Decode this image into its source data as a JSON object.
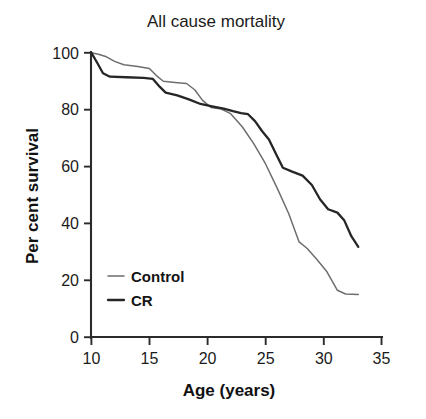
{
  "chart_data": {
    "type": "line",
    "title": "All cause mortality",
    "xlabel": "Age (years)",
    "ylabel": "Per cent survival",
    "xlim": [
      10,
      35
    ],
    "ylim": [
      0,
      100
    ],
    "xticks": [
      10,
      15,
      20,
      25,
      30,
      35
    ],
    "yticks": [
      0,
      20,
      40,
      60,
      80,
      100
    ],
    "xtick_labels": [
      "10",
      "15",
      "20",
      "25",
      "30",
      "35"
    ],
    "ytick_labels": [
      "0",
      "20",
      "40",
      "60",
      "80",
      "100"
    ],
    "grid": false,
    "legend_position": "lower-left-inside",
    "series": [
      {
        "name": "Control",
        "color": "#6e6e6e",
        "line_width": 1.5,
        "points": [
          [
            10.0,
            100.0
          ],
          [
            10.6,
            99.5
          ],
          [
            11.3,
            98.6
          ],
          [
            12.0,
            97.0
          ],
          [
            12.8,
            95.8
          ],
          [
            14.0,
            95.2
          ],
          [
            15.0,
            94.5
          ],
          [
            15.6,
            92.0
          ],
          [
            16.2,
            90.0
          ],
          [
            17.2,
            89.6
          ],
          [
            18.2,
            89.2
          ],
          [
            18.9,
            87.0
          ],
          [
            19.6,
            83.2
          ],
          [
            20.3,
            80.8
          ],
          [
            21.2,
            80.2
          ],
          [
            22.0,
            78.6
          ],
          [
            23.0,
            74.0
          ],
          [
            24.0,
            68.0
          ],
          [
            25.0,
            61.0
          ],
          [
            26.0,
            52.5
          ],
          [
            27.0,
            43.5
          ],
          [
            27.9,
            33.5
          ],
          [
            28.6,
            31.2
          ],
          [
            29.4,
            27.5
          ],
          [
            30.3,
            23.0
          ],
          [
            31.2,
            16.5
          ],
          [
            31.9,
            15.2
          ],
          [
            33.0,
            15.0
          ]
        ]
      },
      {
        "name": "CR",
        "color": "#262626",
        "line_width": 2.3,
        "points": [
          [
            10.0,
            100.0
          ],
          [
            10.5,
            96.5
          ],
          [
            11.0,
            92.8
          ],
          [
            11.6,
            91.6
          ],
          [
            13.0,
            91.4
          ],
          [
            14.5,
            91.2
          ],
          [
            15.3,
            90.8
          ],
          [
            15.9,
            88.0
          ],
          [
            16.4,
            86.0
          ],
          [
            17.4,
            85.0
          ],
          [
            18.4,
            83.6
          ],
          [
            19.4,
            82.0
          ],
          [
            20.4,
            81.2
          ],
          [
            21.4,
            80.4
          ],
          [
            22.2,
            79.5
          ],
          [
            22.9,
            78.8
          ],
          [
            23.5,
            78.4
          ],
          [
            24.1,
            76.0
          ],
          [
            24.7,
            72.5
          ],
          [
            25.3,
            69.5
          ],
          [
            25.9,
            64.5
          ],
          [
            26.5,
            59.6
          ],
          [
            27.3,
            58.2
          ],
          [
            28.2,
            56.8
          ],
          [
            29.0,
            53.5
          ],
          [
            29.7,
            48.5
          ],
          [
            30.4,
            45.0
          ],
          [
            31.2,
            43.8
          ],
          [
            31.8,
            41.0
          ],
          [
            32.4,
            35.5
          ],
          [
            33.0,
            31.8
          ]
        ]
      }
    ],
    "legend_entries": [
      {
        "label": "Control",
        "color": "#6e6e6e",
        "line_width": 1.5
      },
      {
        "label": "CR",
        "color": "#262626",
        "line_width": 2.3
      }
    ]
  }
}
